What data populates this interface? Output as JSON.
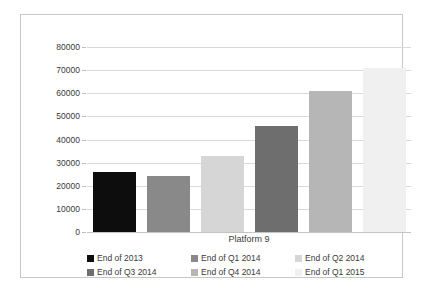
{
  "chart_data": {
    "type": "bar",
    "title": "",
    "subtitle": "",
    "xlabel": "Platform 9",
    "ylabel": "",
    "categories": [
      "Platform 9"
    ],
    "ylim": [
      0,
      80000
    ],
    "yticks": [
      0,
      10000,
      20000,
      30000,
      40000,
      50000,
      60000,
      70000,
      80000
    ],
    "ytick_labels": [
      "0",
      "10000",
      "20000",
      "30000",
      "40000",
      "50000",
      "60000",
      "70000",
      "80000"
    ],
    "grid": true,
    "legend_position": "bottom",
    "series": [
      {
        "name": "End of 2013",
        "values": [
          26000
        ],
        "color": "#0d0d0d"
      },
      {
        "name": "End of Q1 2014",
        "values": [
          24100
        ],
        "color": "#898989"
      },
      {
        "name": "End of Q2 2014",
        "values": [
          32700
        ],
        "color": "#d6d6d6"
      },
      {
        "name": "End of Q3 2014",
        "values": [
          46000
        ],
        "color": "#6e6e6e"
      },
      {
        "name": "End of Q4 2014",
        "values": [
          61000
        ],
        "color": "#b6b6b6"
      },
      {
        "name": "End of Q1 2015",
        "values": [
          71000
        ],
        "color": "#f0f0f0"
      }
    ]
  },
  "legend": {
    "items": [
      {
        "label": "End of 2013",
        "color": "#0d0d0d"
      },
      {
        "label": "End of Q1 2014",
        "color": "#898989"
      },
      {
        "label": "End of Q2 2014",
        "color": "#d6d6d6"
      },
      {
        "label": "End of Q3 2014",
        "color": "#6e6e6e"
      },
      {
        "label": "End of Q4 2014",
        "color": "#b6b6b6"
      },
      {
        "label": "End of Q1 2015",
        "color": "#f0f0f0"
      }
    ]
  },
  "axis": {
    "x_category_label": "Platform 9"
  }
}
